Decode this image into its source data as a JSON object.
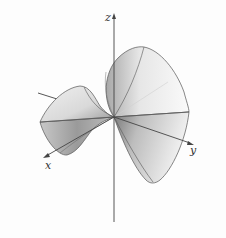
{
  "figure": {
    "axes": {
      "x_label": "x",
      "y_label": "y",
      "z_label": "z"
    },
    "colors": {
      "background": "#fdfdfd",
      "axis": "#444444",
      "surface_edge": "#555555",
      "surface_light": "#f2f2f2",
      "surface_dark": "#8a8a8a"
    }
  }
}
